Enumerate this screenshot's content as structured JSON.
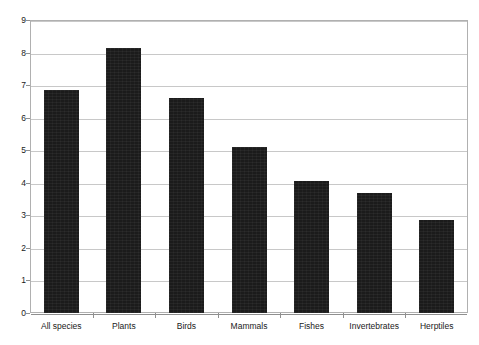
{
  "chart_data": {
    "type": "bar",
    "title": "",
    "xlabel": "",
    "ylabel": "Average number of years",
    "categories": [
      "All species",
      "Plants",
      "Birds",
      "Mammals",
      "Fishes",
      "Invertebrates",
      "Herptiles"
    ],
    "values": [
      6.85,
      8.15,
      6.6,
      5.1,
      4.05,
      3.7,
      2.85
    ],
    "ylim": [
      0,
      9
    ],
    "ytick_labels": [
      "0",
      "1",
      "2",
      "3",
      "4",
      "5",
      "6",
      "7",
      "8",
      "9"
    ],
    "ytick_values": [
      0,
      1,
      2,
      3,
      4,
      5,
      6,
      7,
      8,
      9
    ],
    "grid": true,
    "legend": false,
    "bar_color": "#1b1b1b",
    "grid_color": "#c8c8c8",
    "axis_color": "#8f8f8f",
    "background_color": "#ffffff"
  }
}
